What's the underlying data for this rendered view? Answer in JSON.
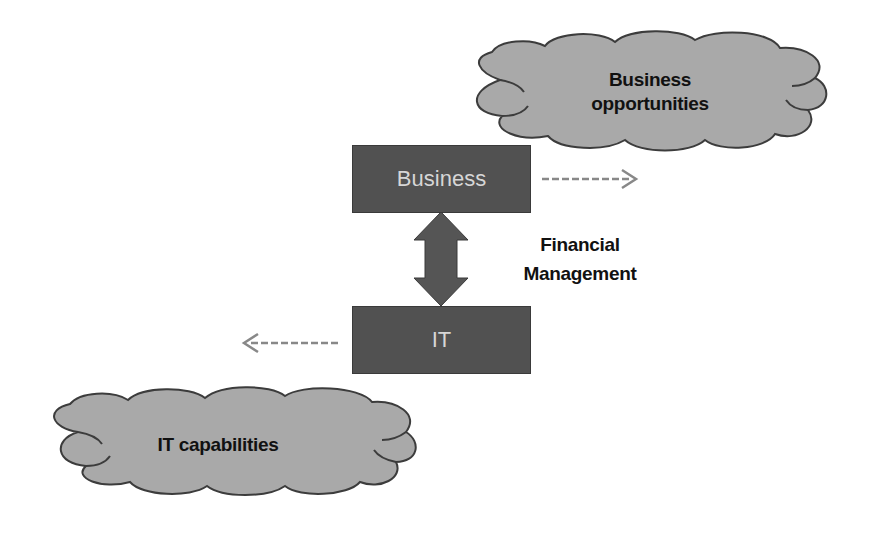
{
  "diagram": {
    "nodes": {
      "business_box": {
        "label": "Business"
      },
      "it_box": {
        "label": "IT"
      },
      "business_cloud": {
        "line1": "Business",
        "line2": "opportunities"
      },
      "it_cloud": {
        "label": "IT capabilities"
      }
    },
    "connector": {
      "label_line1": "Financial",
      "label_line2": "Management"
    },
    "edges": [
      {
        "from": "Business",
        "to": "Business opportunities",
        "style": "dashed",
        "direction": "right"
      },
      {
        "from": "IT",
        "to": "IT capabilities",
        "style": "dashed",
        "direction": "left"
      },
      {
        "from": "Business",
        "to": "IT",
        "style": "solid-block",
        "direction": "bidirectional"
      }
    ],
    "colors": {
      "box_fill": "#515151",
      "box_text": "#d6d6d6",
      "cloud_fill": "#a9a9a9",
      "cloud_stroke": "#3c3c3c",
      "arrow_fill": "#555555",
      "dashed_arrow": "#888888",
      "label_text": "#111111"
    }
  }
}
